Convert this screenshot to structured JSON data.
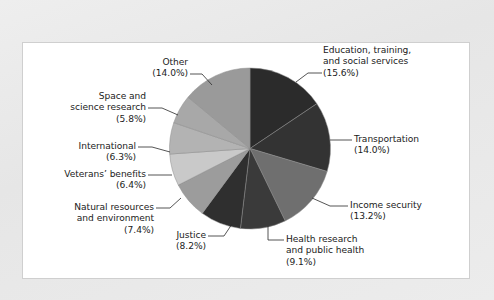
{
  "figure": {
    "background_color": "#ffffff",
    "page_color": "#eaeaea",
    "border_color": "#cfcfcf"
  },
  "chart_data": {
    "type": "pie",
    "title": "",
    "subtitle": "",
    "xlabel": "",
    "ylabel": "",
    "legend_position": "none",
    "grid": false,
    "value_unit": "percent",
    "start_angle_deg": 0,
    "direction": "clockwise",
    "categories": [
      "Education, training, and social services",
      "Transportation",
      "Income security",
      "Health research and public health",
      "Justice",
      "Natural resources and environment",
      "Veterans' benefits",
      "International",
      "Space and science research",
      "Other"
    ],
    "values": [
      15.6,
      14.0,
      13.2,
      9.1,
      8.2,
      7.4,
      6.4,
      6.3,
      5.8,
      14.0
    ],
    "colors": [
      "#2b2b2b",
      "#333333",
      "#6f6f6f",
      "#3a3a3a",
      "#2f2f2f",
      "#9c9c9c",
      "#c9c9c9",
      "#b3b3b3",
      "#a8a8a8",
      "#9a9a9a"
    ],
    "slices": [
      {
        "label": "Education, training, and social services",
        "value": 15.6,
        "display": "(15.6%)",
        "color": "#2b2b2b"
      },
      {
        "label": "Transportation",
        "value": 14.0,
        "display": "(14.0%)",
        "color": "#333333"
      },
      {
        "label": "Income security",
        "value": 13.2,
        "display": "(13.2%)",
        "color": "#6f6f6f"
      },
      {
        "label": "Health research and public health",
        "value": 9.1,
        "display": "(9.1%)",
        "color": "#3a3a3a"
      },
      {
        "label": "Justice",
        "value": 8.2,
        "display": "(8.2%)",
        "color": "#2f2f2f"
      },
      {
        "label": "Natural resources and environment",
        "value": 7.4,
        "display": "(7.4%)",
        "color": "#9c9c9c"
      },
      {
        "label": "Veterans' benefits",
        "value": 6.4,
        "display": "(6.4%)",
        "color": "#c9c9c9"
      },
      {
        "label": "International",
        "value": 6.3,
        "display": "(6.3%)",
        "color": "#b3b3b3"
      },
      {
        "label": "Space and science research",
        "value": 5.8,
        "display": "(5.8%)",
        "color": "#a8a8a8"
      },
      {
        "label": "Other",
        "value": 14.0,
        "display": "(14.0%)",
        "color": "#9a9a9a"
      }
    ]
  },
  "labels": {
    "education_line1": "Education, training,",
    "education_line2": "and social services",
    "education_pct": "(15.6%)",
    "transportation_line1": "Transportation",
    "transportation_pct": "(14.0%)",
    "income_line1": "Income security",
    "income_pct": "(13.2%)",
    "health_line1": "Health research",
    "health_line2": "and public health",
    "health_pct": "(9.1%)",
    "justice_line1": "Justice",
    "justice_pct": "(8.2%)",
    "natural_line1": "Natural resources",
    "natural_line2": "and environment",
    "natural_pct": "(7.4%)",
    "veterans_line1": "Veterans’ benefits",
    "veterans_pct": "(6.4%)",
    "international_line1": "International",
    "international_pct": "(6.3%)",
    "space_line1": "Space and",
    "space_line2": "science research",
    "space_pct": "(5.8%)",
    "other_line1": "Other",
    "other_pct": "(14.0%)"
  }
}
